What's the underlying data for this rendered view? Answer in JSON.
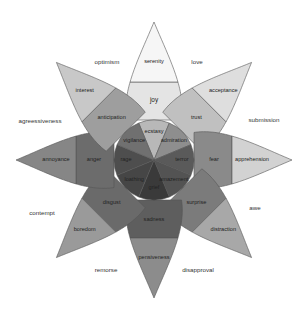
{
  "diagram": {
    "center": {
      "x": 154,
      "y": 160
    },
    "petals": [
      {
        "direction": "top",
        "angle": -90,
        "inner": "ecstasy",
        "middle": "joy",
        "outer": "serenity",
        "colors": [
          "#b8b8b8",
          "#e4e4e4",
          "#f6f6f6"
        ]
      },
      {
        "direction": "top-right",
        "angle": -45,
        "inner": "admiration",
        "middle": "trust",
        "outer": "acceptance",
        "colors": [
          "#8e8e8e",
          "#c0c0c0",
          "#dedede"
        ]
      },
      {
        "direction": "right",
        "angle": 0,
        "inner": "terror",
        "middle": "fear",
        "outer": "apprehension",
        "colors": [
          "#5a5a5a",
          "#8a8a8a",
          "#d2d2d2"
        ]
      },
      {
        "direction": "bottom-right",
        "angle": 45,
        "inner": "amazement",
        "middle": "surprise",
        "outer": "distraction",
        "colors": [
          "#535353",
          "#7b7b7b",
          "#a8a8a8"
        ]
      },
      {
        "direction": "bottom",
        "angle": 90,
        "inner": "grief",
        "middle": "sadness",
        "outer": "pensiveness",
        "colors": [
          "#3a3a3a",
          "#5e5e5e",
          "#8c8c8c"
        ]
      },
      {
        "direction": "bottom-left",
        "angle": 135,
        "inner": "loathing",
        "middle": "disgust",
        "outer": "boredom",
        "colors": [
          "#464646",
          "#6a6a6a",
          "#9a9a9a"
        ]
      },
      {
        "direction": "left",
        "angle": 180,
        "inner": "rage",
        "middle": "anger",
        "outer": "annoyance",
        "colors": [
          "#4e4e4e",
          "#6c6c6c",
          "#868686"
        ]
      },
      {
        "direction": "top-left",
        "angle": -135,
        "inner": "vigilance",
        "middle": "anticipation",
        "outer": "interest",
        "colors": [
          "#707070",
          "#9e9e9e",
          "#c8c8c8"
        ]
      }
    ],
    "dyads": [
      {
        "label": "optimism",
        "x": 107,
        "y": 62
      },
      {
        "label": "love",
        "x": 197,
        "y": 62
      },
      {
        "label": "submission",
        "x": 264,
        "y": 120
      },
      {
        "label": "awe",
        "x": 255,
        "y": 208
      },
      {
        "label": "disapproval",
        "x": 198,
        "y": 270
      },
      {
        "label": "remorse",
        "x": 106,
        "y": 270
      },
      {
        "label": "contempt",
        "x": 42,
        "y": 213
      },
      {
        "label": "agreessiveness",
        "x": 40,
        "y": 121
      }
    ]
  }
}
